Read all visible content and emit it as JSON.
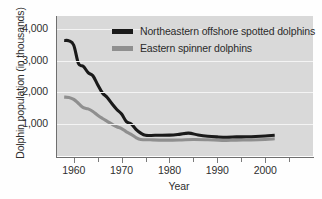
{
  "chart_data": {
    "type": "line",
    "title": "",
    "xlabel": "Year",
    "ylabel": "Dolphin population (in thousands)",
    "xlim": [
      1956.5,
      2010
    ],
    "ylim": [
      0,
      4400
    ],
    "grid": true,
    "grid_orientation": "horizontal",
    "legend_position": "upper center",
    "xticks": [
      1960,
      1970,
      1980,
      1990,
      2000
    ],
    "xtick_labels": [
      "1960",
      "1970",
      "1980",
      "1990",
      "2000"
    ],
    "xminor_ticks": [
      1965,
      1975,
      1985,
      1995,
      2005
    ],
    "yticks": [
      1000,
      2000,
      3000,
      4000
    ],
    "ytick_labels": [
      "1,000",
      "2,000",
      "3,000",
      "4,000"
    ],
    "series": [
      {
        "name": "Northeastern offshore spotted dolphins",
        "color": "#1a1a1a",
        "linewidth": 3.1,
        "x": [
          1958,
          1959,
          1960,
          1961,
          1962,
          1963,
          1964,
          1965,
          1966,
          1967,
          1968,
          1969,
          1970,
          1971,
          1972,
          1973,
          1974,
          1975,
          1977,
          1980,
          1982,
          1984,
          1986,
          1988,
          1990,
          1992,
          1994,
          1996,
          1998,
          2000,
          2002
        ],
        "values": [
          3630,
          3620,
          3480,
          2900,
          2820,
          2620,
          2520,
          2240,
          1980,
          1840,
          1640,
          1460,
          1320,
          1080,
          1010,
          840,
          720,
          650,
          650,
          655,
          680,
          720,
          660,
          620,
          600,
          590,
          600,
          605,
          615,
          630,
          650
        ]
      },
      {
        "name": "Eastern spinner dolphins",
        "color": "#8f8f8f",
        "linewidth": 3.1,
        "x": [
          1958,
          1959,
          1960,
          1961,
          1962,
          1963,
          1964,
          1965,
          1966,
          1967,
          1968,
          1969,
          1970,
          1971,
          1972,
          1973,
          1974,
          1976,
          1979,
          1982,
          1985,
          1988,
          1991,
          1994,
          1997,
          2000,
          2002
        ],
        "values": [
          1850,
          1840,
          1780,
          1650,
          1520,
          1480,
          1400,
          1280,
          1180,
          1090,
          1000,
          920,
          860,
          760,
          680,
          580,
          520,
          510,
          500,
          505,
          520,
          510,
          490,
          500,
          505,
          520,
          540
        ]
      }
    ],
    "legend": [
      {
        "label": "Northeastern offshore spotted dolphins",
        "color": "#1a1a1a"
      },
      {
        "label": "Eastern spinner dolphins",
        "color": "#8f8f8f"
      }
    ],
    "colors": {
      "plot_background": "#d9d9d9",
      "figure_background": "#fefefe",
      "gridline": "#f4f4f4",
      "axis": "#6f6f6f",
      "text": "#2e2e2e"
    }
  }
}
